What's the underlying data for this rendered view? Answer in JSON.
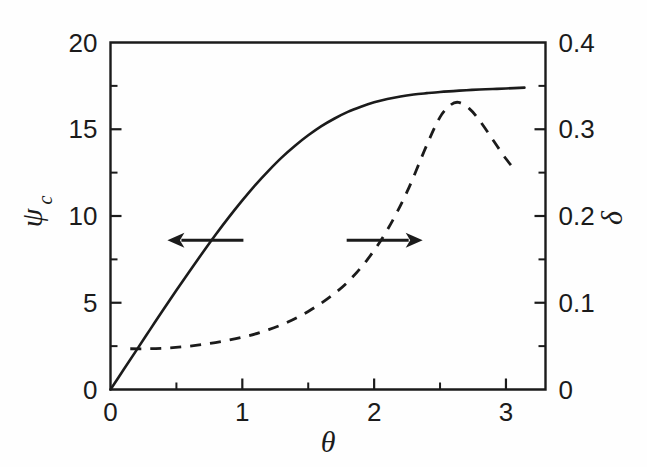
{
  "figure": {
    "background_color": "#fefefe",
    "ink_color": "#1b1b1b"
  },
  "chart_data": {
    "type": "line",
    "title": "",
    "subtitle": "",
    "xlabel": "θ",
    "ylabel": "ψ",
    "ylabel_sub": "c",
    "y2label": "δ",
    "xlim": [
      0,
      3.3
    ],
    "ylim": [
      0,
      20
    ],
    "y2lim": [
      0,
      0.4
    ],
    "grid": false,
    "legend": "none",
    "annotations": [
      {
        "name": "left-arrow",
        "points_to": "left-axis",
        "direction": "left",
        "x_data": 0.72,
        "y_data": 8.6
      },
      {
        "name": "right-arrow",
        "points_to": "right-axis",
        "direction": "right",
        "x_data": 2.08,
        "y_data": 8.6
      }
    ],
    "x_ticks_major": [
      "0",
      "1",
      "2",
      "3"
    ],
    "x_ticks_major_values": [
      0,
      1,
      2,
      3
    ],
    "x_ticks_minor_values": [
      0.5,
      1.5,
      2.5
    ],
    "y_ticks_major": [
      "0",
      "5",
      "10",
      "15",
      "20"
    ],
    "y_ticks_major_values": [
      0,
      5,
      10,
      15,
      20
    ],
    "y_ticks_minor_values": [
      2.5,
      7.5,
      12.5,
      17.5
    ],
    "y2_ticks_major": [
      "0",
      "0.1",
      "0.2",
      "0.3",
      "0.4"
    ],
    "y2_ticks_major_values": [
      0,
      0.1,
      0.2,
      0.3,
      0.4
    ],
    "y2_ticks_minor_values": [
      0.05,
      0.15,
      0.25,
      0.35
    ],
    "series": [
      {
        "name": "psi_c",
        "label": "ψc",
        "axis": "left",
        "style": "solid",
        "color": "#1b1b1b",
        "x": [
          0.0,
          0.1,
          0.2,
          0.3,
          0.4,
          0.5,
          0.6,
          0.7,
          0.8,
          0.9,
          1.0,
          1.1,
          1.2,
          1.3,
          1.4,
          1.5,
          1.6,
          1.7,
          1.8,
          1.9,
          2.0,
          2.1,
          2.2,
          2.3,
          2.4,
          2.5,
          2.6,
          2.7,
          2.8,
          2.9,
          3.0,
          3.14
        ],
        "y": [
          0.0,
          1.15,
          2.3,
          3.45,
          4.6,
          5.72,
          6.82,
          7.9,
          8.95,
          9.95,
          10.9,
          11.8,
          12.62,
          13.38,
          14.05,
          14.65,
          15.18,
          15.62,
          16.0,
          16.3,
          16.55,
          16.74,
          16.89,
          17.0,
          17.08,
          17.15,
          17.2,
          17.25,
          17.29,
          17.32,
          17.35,
          17.4
        ]
      },
      {
        "name": "delta",
        "label": "δ",
        "axis": "right",
        "style": "dashed",
        "color": "#1b1b1b",
        "x": [
          0.15,
          0.3,
          0.45,
          0.6,
          0.75,
          0.9,
          1.05,
          1.2,
          1.35,
          1.5,
          1.65,
          1.8,
          1.95,
          2.1,
          2.25,
          2.4,
          2.5,
          2.58,
          2.64,
          2.72,
          2.8,
          2.9,
          3.0,
          3.08
        ],
        "y": [
          0.047,
          0.047,
          0.048,
          0.05,
          0.053,
          0.057,
          0.062,
          0.069,
          0.078,
          0.09,
          0.105,
          0.124,
          0.15,
          0.184,
          0.228,
          0.282,
          0.314,
          0.328,
          0.331,
          0.324,
          0.31,
          0.288,
          0.266,
          0.251
        ]
      }
    ]
  }
}
